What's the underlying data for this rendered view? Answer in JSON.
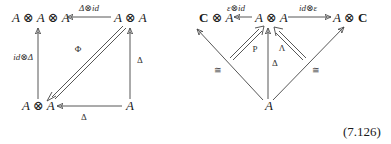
{
  "left_diagram": {
    "nodes": {
      "top_left": "A ⊗ A ⊗ A",
      "top_right": "A ⊗ A",
      "bottom_left": "A ⊗ A",
      "bottom_right": "A"
    },
    "arrows": {
      "top": "Δ⊗id",
      "left": "id⊗Δ",
      "right": "Δ",
      "bottom": "Δ",
      "diagonal": "Φ"
    }
  },
  "right_diagram": {
    "nodes": {
      "left": "C",
      "left_rest": " ⊗ A",
      "center": "A ⊗ A",
      "right_start": "A ⊗ ",
      "right": "C",
      "bottom": "A"
    },
    "arrows": {
      "to_left": "ε⊗id",
      "to_right": "id⊗ε",
      "double_left": "P",
      "double_right": "Λ",
      "vertical": "Δ",
      "iso_left": "≅",
      "iso_right": "≅"
    }
  },
  "equation_number": "(7.126)"
}
